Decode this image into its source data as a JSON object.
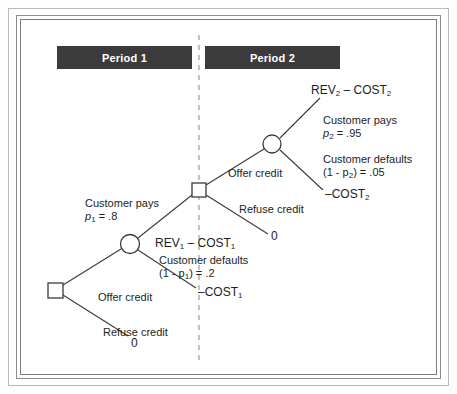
{
  "figure": {
    "type": "decision-tree"
  },
  "banners": {
    "period1": "Period 1",
    "period2": "Period 2",
    "divider_label": "period divider"
  },
  "colors": {
    "banner_bg": "#3b3b3b",
    "banner_text": "#ffffff",
    "line": "#3a3a3a",
    "divider": "#9a9a9a",
    "frame": "#8d8d8d",
    "background": "#ffffff"
  },
  "nodes": [
    {
      "id": "root-decision",
      "shape": "square",
      "x": 56,
      "y": 290,
      "name": "root-decision-node"
    },
    {
      "id": "period1-chance",
      "shape": "circle",
      "x": 130,
      "y": 244,
      "name": "period1-chance-node"
    },
    {
      "id": "period2-decision",
      "shape": "square",
      "x": 199,
      "y": 190,
      "name": "period2-decision-node"
    },
    {
      "id": "period2-chance",
      "shape": "circle",
      "x": 272,
      "y": 144,
      "name": "period2-chance-node"
    }
  ],
  "labels": {
    "offer_credit_p1": "Offer credit",
    "refuse_credit_p1": "Refuse credit",
    "refuse_payoff_p1": "0",
    "customer_pays_p1_line1": "Customer pays",
    "customer_pays_p1_line2_pre": "p",
    "customer_pays_p1_line2_sub": "1",
    "customer_pays_p1_line2_post": " = .8",
    "pays_payoff_p1_rev": "REV",
    "pays_payoff_p1_rev_sub": "1",
    "pays_payoff_p1_mid": " – COST",
    "pays_payoff_p1_cost_sub": "1",
    "customer_defaults_p1_line1": "Customer defaults",
    "customer_defaults_p1_line2_pre": "(1 - p",
    "customer_defaults_p1_line2_sub": "1",
    "customer_defaults_p1_line2_post": ") = .2",
    "default_payoff_p1_pre": "–COST",
    "default_payoff_p1_sub": "1",
    "offer_credit_p2": "Offer credit",
    "refuse_credit_p2": "Refuse credit",
    "refuse_payoff_p2": "0",
    "customer_pays_p2_line1": "Customer pays",
    "customer_pays_p2_line2_pre": "p",
    "customer_pays_p2_line2_sub": "2",
    "customer_pays_p2_line2_post": " = .95",
    "pays_payoff_p2_rev": "REV",
    "pays_payoff_p2_rev_sub": "2",
    "pays_payoff_p2_mid": " – COST",
    "pays_payoff_p2_cost_sub": "2",
    "customer_defaults_p2_line1": "Customer defaults",
    "customer_defaults_p2_line2_pre": "(1 - p",
    "customer_defaults_p2_line2_sub": "2",
    "customer_defaults_p2_line2_post": ") = .05",
    "default_payoff_p2_pre": "–COST",
    "default_payoff_p2_sub": "2"
  },
  "probabilities": {
    "p1_pays": 0.8,
    "p1_defaults": 0.2,
    "p2_pays": 0.95,
    "p2_defaults": 0.05
  }
}
